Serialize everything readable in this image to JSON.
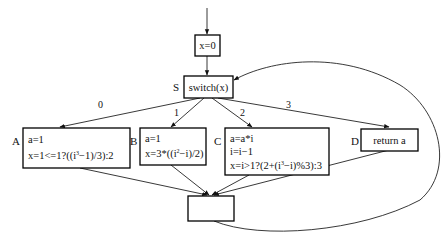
{
  "diagram": {
    "type": "control-flow-graph",
    "nodes": {
      "init": {
        "lines": [
          "x=0"
        ]
      },
      "switch": {
        "label": "S",
        "lines": [
          "switch(x)"
        ]
      },
      "A": {
        "label": "A",
        "line1": "a=1",
        "line2_pre": "x=1<=1?((i",
        "line2_sup": "3",
        "line2_post": "−1)/3):2"
      },
      "B": {
        "label": "B",
        "line1": "a=1",
        "line2_pre": "x=3*((i",
        "line2_sup": "2",
        "line2_post": "−i)/2)"
      },
      "C": {
        "label": "C",
        "line1": "a=a*i",
        "line2": "i=i−1",
        "line3_pre": "x=i>1?(2+(i",
        "line3_sup": "3",
        "line3_post": "−i)%3):3"
      },
      "D": {
        "label": "D",
        "lines": [
          "return a"
        ]
      },
      "merge": {
        "lines": []
      }
    },
    "edges": [
      {
        "from": "entry",
        "to": "init",
        "label": ""
      },
      {
        "from": "init",
        "to": "switch",
        "label": ""
      },
      {
        "from": "switch",
        "to": "A",
        "label": "0"
      },
      {
        "from": "switch",
        "to": "B",
        "label": "1"
      },
      {
        "from": "switch",
        "to": "C",
        "label": "2"
      },
      {
        "from": "switch",
        "to": "D",
        "label": "3"
      },
      {
        "from": "A",
        "to": "merge",
        "label": ""
      },
      {
        "from": "B",
        "to": "merge",
        "label": ""
      },
      {
        "from": "C",
        "to": "merge",
        "label": ""
      },
      {
        "from": "D",
        "to": "merge",
        "label": ""
      },
      {
        "from": "merge",
        "to": "switch",
        "label": ""
      }
    ],
    "colors": {
      "stroke": "#000000",
      "background": "#ffffff",
      "text": "#111111"
    }
  }
}
